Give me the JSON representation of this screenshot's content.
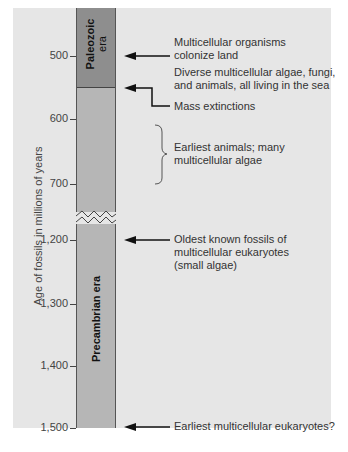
{
  "diagram": {
    "axis": {
      "label": "Age of fossils in millions of years",
      "ticks": [
        {
          "label": "500",
          "y": 56
        },
        {
          "label": "600",
          "y": 119
        },
        {
          "label": "700",
          "y": 184
        },
        {
          "label": "1,200",
          "y": 240
        },
        {
          "label": "1,300",
          "y": 304
        },
        {
          "label": "1,400",
          "y": 366
        },
        {
          "label": "1,500",
          "y": 428
        }
      ]
    },
    "eras": {
      "paleozoic": {
        "line1": "Paleozoic",
        "line2": "era"
      },
      "precambrian": "Precambrian era"
    },
    "annotations": {
      "land": {
        "line1": "Multicellular organisms",
        "line2": "colonize land"
      },
      "diverse": {
        "line1": "Diverse multicellular algae, fungi,",
        "line2": "and animals, all living in the sea"
      },
      "extinctions": "Mass extinctions",
      "earliest_animals": {
        "line1": "Earliest animals; many",
        "line2": "multicellular algae"
      },
      "oldest_fossils": {
        "line1": "Oldest known fossils of",
        "line2": "multicellular eukaryotes",
        "line3": "(small algae)"
      },
      "earliest_eukaryotes": "Earliest multicellular eukaryotes?"
    },
    "colors": {
      "panel": "#e6e6e6",
      "paleozoic": "#8e8e8e",
      "precambrian": "#b6b6b6"
    }
  }
}
